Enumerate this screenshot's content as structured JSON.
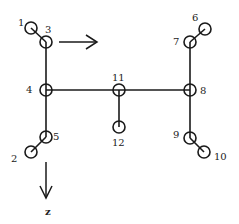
{
  "diagram": {
    "type": "network-graph",
    "colors": {
      "stroke": "#1a1a1a",
      "text": "#222222",
      "background": "#ffffff"
    },
    "nodes": [
      {
        "id": "1",
        "label": "1",
        "x": 31,
        "y": 28
      },
      {
        "id": "2",
        "label": "2",
        "x": 31,
        "y": 152
      },
      {
        "id": "3",
        "label": "3",
        "x": 46,
        "y": 42
      },
      {
        "id": "4",
        "label": "4",
        "x": 46,
        "y": 90
      },
      {
        "id": "5",
        "label": "5",
        "x": 46,
        "y": 137
      },
      {
        "id": "6",
        "label": "6",
        "x": 205,
        "y": 29
      },
      {
        "id": "7",
        "label": "7",
        "x": 190,
        "y": 42
      },
      {
        "id": "8",
        "label": "8",
        "x": 190,
        "y": 90
      },
      {
        "id": "9",
        "label": "9",
        "x": 190,
        "y": 138
      },
      {
        "id": "10",
        "label": "10",
        "x": 204,
        "y": 152
      },
      {
        "id": "11",
        "label": "11",
        "x": 119,
        "y": 90
      },
      {
        "id": "12",
        "label": "12",
        "x": 119,
        "y": 127
      }
    ],
    "edges": [
      [
        "1",
        "3"
      ],
      [
        "3",
        "4"
      ],
      [
        "4",
        "5"
      ],
      [
        "5",
        "2"
      ],
      [
        "4",
        "11"
      ],
      [
        "11",
        "8"
      ],
      [
        "11",
        "12"
      ],
      [
        "6",
        "7"
      ],
      [
        "7",
        "8"
      ],
      [
        "8",
        "9"
      ],
      [
        "9",
        "10"
      ]
    ],
    "arrows": [
      {
        "name": "direction-arrow-right",
        "from": [
          59,
          42
        ],
        "to": [
          97,
          42
        ],
        "label": ""
      },
      {
        "name": "z-axis-arrow-down",
        "from": [
          46,
          162
        ],
        "to": [
          46,
          198
        ],
        "label": "z"
      }
    ],
    "labels": {
      "n1": "1",
      "n2": "2",
      "n3": "3",
      "n4": "4",
      "n5": "5",
      "n6": "6",
      "n7": "7",
      "n8": "8",
      "n9": "9",
      "n10": "10",
      "n11": "11",
      "n12": "12",
      "z_axis": "z"
    }
  }
}
